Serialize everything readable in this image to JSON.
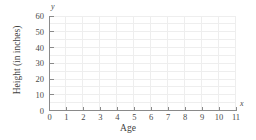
{
  "chart_data": {
    "type": "scatter",
    "title": "",
    "subtitle": "",
    "xlabel": "Age",
    "ylabel": "Height (in inches)",
    "x_axis_letter": "x",
    "y_axis_letter": "y",
    "xlim": [
      0,
      11
    ],
    "ylim": [
      0,
      60
    ],
    "x_ticks": [
      0,
      1,
      2,
      3,
      4,
      5,
      6,
      7,
      8,
      9,
      10,
      11
    ],
    "y_ticks": [
      0,
      10,
      20,
      30,
      40,
      50,
      60
    ],
    "x_tick_labels": [
      "0",
      "1",
      "2",
      "3",
      "4",
      "5",
      "6",
      "7",
      "8",
      "9",
      "10",
      "11"
    ],
    "y_tick_labels": [
      "0",
      "10",
      "20",
      "30",
      "40",
      "50",
      "60"
    ],
    "x_minor_step": 1,
    "y_minor_step": 5,
    "grid": true,
    "grid_color": "#eeeeee",
    "axis_color": "#8a8a8a",
    "legend": null,
    "legend_position": "none",
    "series": [],
    "values": [],
    "annotations": [],
    "note": "empty coordinate grid; no data plotted"
  }
}
